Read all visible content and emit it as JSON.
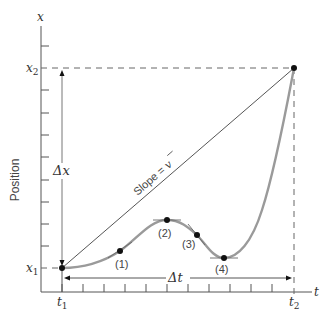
{
  "diagram": {
    "type": "position-time graph",
    "axes": {
      "y_axis_letter": "x",
      "x_axis_letter": "t",
      "y_axis_title": "Position"
    },
    "ticks": {
      "x1": "x",
      "x1_sub": "1",
      "x2": "x",
      "x2_sub": "2",
      "t1": "t",
      "t1_sub": "1",
      "t2": "t",
      "t2_sub": "2"
    },
    "annotations": {
      "delta_x": "Δx",
      "delta_t": "Δt",
      "slope_label": "Slope = ",
      "slope_symbol": "v"
    },
    "points": [
      {
        "label": "(1)"
      },
      {
        "label": "(2)"
      },
      {
        "label": "(3)"
      },
      {
        "label": "(4)"
      }
    ],
    "colors": {
      "axis": "#555555",
      "curve": "#9a9a9a",
      "line": "#555555",
      "dot": "#111111"
    }
  }
}
